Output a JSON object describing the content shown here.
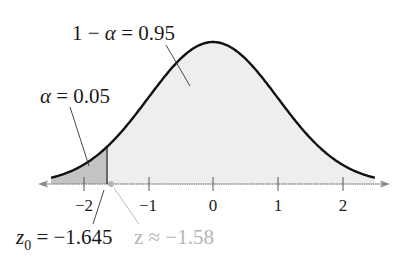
{
  "chart_data": {
    "type": "area",
    "title": "",
    "xlabel": "",
    "ylabel": "",
    "x_ticks": [
      -2,
      -1,
      0,
      1,
      2
    ],
    "x_tick_labels": [
      "−2",
      "−1",
      "0",
      "1",
      "2"
    ],
    "xlim": [
      -2.5,
      2.5
    ],
    "curve": "standard normal pdf",
    "regions": [
      {
        "name": "rejection",
        "from": -2.5,
        "to": -1.645,
        "area": 0.05,
        "fill": "#c4c4c4"
      },
      {
        "name": "acceptance",
        "from": -1.645,
        "to": 2.5,
        "area": 0.95,
        "fill": "#eeeeee"
      }
    ],
    "annotations": [
      {
        "text": "1 − α = 0.95",
        "target": "acceptance region"
      },
      {
        "text": "α = 0.05",
        "target": "rejection region"
      },
      {
        "text": "z₀ = −1.645",
        "target": "critical value",
        "x": -1.645
      },
      {
        "text": "z ≈ −1.58",
        "target": "test statistic",
        "x": -1.58,
        "style": "gray"
      }
    ],
    "grid": false,
    "legend": "none"
  },
  "labels": {
    "acceptance_base": "1 − ",
    "alpha": "α",
    "acceptance_value": " = 0.95",
    "rejection_value": " = 0.05",
    "z0_base": "z",
    "z0_sub": "0",
    "z0_value": " = −1.645",
    "z_stat": "z ≈ −1.58"
  },
  "ticks": {
    "t0": "−2",
    "t1": "−1",
    "t2": "0",
    "t3": "1",
    "t4": "2"
  },
  "colors": {
    "curve": "#111111",
    "rejection_fill": "#c4c4c4",
    "acceptance_fill": "#eeeeee",
    "axis": "#777777",
    "test_stat": "#b4b4b4"
  }
}
